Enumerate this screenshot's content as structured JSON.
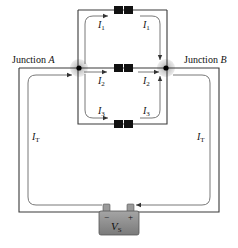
{
  "diagram": {
    "type": "parallel-circuit",
    "junctions": [
      {
        "id": "A",
        "label_prefix": "Junction",
        "label_var": "A"
      },
      {
        "id": "B",
        "label_prefix": "Junction",
        "label_var": "B"
      }
    ],
    "branches": [
      {
        "current": "I",
        "sub": "1"
      },
      {
        "current": "I",
        "sub": "2"
      },
      {
        "current": "I",
        "sub": "3"
      }
    ],
    "total_current": {
      "current": "I",
      "sub": "T"
    },
    "source": {
      "label": "V",
      "sub": "S",
      "neg": "−",
      "pos": "+"
    },
    "colors": {
      "wire": "#3a3a3a",
      "junction_halo": "#bdbdbd",
      "resistor": "#111111",
      "battery": "#8a8a8a"
    }
  }
}
